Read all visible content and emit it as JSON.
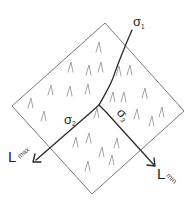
{
  "diagram": {
    "type": "stress-fabric-diagram",
    "block": {
      "shape": "rotated-square",
      "corners": {
        "top": [
          105,
          23
        ],
        "right": [
          184,
          111
        ],
        "bottom": [
          92,
          194
        ],
        "left": [
          12,
          106
        ]
      },
      "fill_pattern": "lambda-marks"
    },
    "junction": [
      99,
      105
    ],
    "axes": [
      {
        "id": "sigma1",
        "label": "σ",
        "subscript": "1",
        "direction": "up-right"
      },
      {
        "id": "sigma2",
        "label": "σ",
        "subscript": "2",
        "direction": "down-left"
      },
      {
        "id": "sigma3",
        "label": "σ",
        "subscript": "3",
        "direction": "down-right"
      }
    ],
    "arrows": [
      {
        "id": "lmax",
        "label": "L",
        "subscript": "max",
        "along": "sigma2"
      },
      {
        "id": "lmin",
        "label": "L",
        "subscript": "min",
        "along": "sigma3"
      }
    ],
    "marks": [
      [
        99,
        47
      ],
      [
        71,
        67
      ],
      [
        89,
        70
      ],
      [
        101,
        67
      ],
      [
        51,
        90
      ],
      [
        70,
        91
      ],
      [
        88,
        89
      ],
      [
        31,
        103
      ],
      [
        44,
        116
      ],
      [
        119,
        71
      ],
      [
        130,
        70
      ],
      [
        145,
        93
      ],
      [
        113,
        97
      ],
      [
        124,
        97
      ],
      [
        137,
        114
      ],
      [
        152,
        121
      ],
      [
        162,
        112
      ],
      [
        97,
        113
      ],
      [
        76,
        142
      ],
      [
        89,
        138
      ],
      [
        102,
        152
      ],
      [
        117,
        143
      ],
      [
        112,
        160
      ],
      [
        88,
        166
      ]
    ],
    "colors": {
      "frame": "#6a6a6a",
      "trace": "#2a2a2a",
      "marks": "#9a9a9a",
      "background": "#ffffff"
    }
  }
}
